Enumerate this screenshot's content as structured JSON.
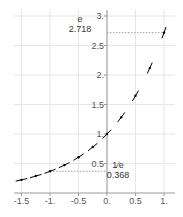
{
  "chart_data": {
    "type": "line",
    "title": "",
    "xlabel": "",
    "ylabel": "",
    "function": "exp(x)",
    "x": [
      -1.5,
      -1.25,
      -1.0,
      -0.75,
      -0.5,
      -0.25,
      0.0,
      0.25,
      0.5,
      0.75,
      1.0
    ],
    "series": [
      {
        "name": "e^x",
        "values": [
          0.223,
          0.287,
          0.368,
          0.472,
          0.607,
          0.779,
          1.0,
          1.284,
          1.649,
          2.117,
          2.718
        ]
      }
    ],
    "xlim": [
      -1.6,
      1.05
    ],
    "ylim": [
      0,
      3.05
    ],
    "x_ticks": [
      "-1.5",
      "-1.",
      "-0.5",
      "0.",
      "0.5",
      "1."
    ],
    "x_tick_values": [
      -1.5,
      -1.0,
      -0.5,
      0.0,
      0.5,
      1.0
    ],
    "y_ticks": [
      "0.5",
      "1.",
      "1.5",
      "2.",
      "2.5",
      "3."
    ],
    "y_tick_values": [
      0.5,
      1.0,
      1.5,
      2.0,
      2.5,
      3.0
    ],
    "grid": true,
    "annotations": [
      {
        "label": "e",
        "value": "2.718",
        "x": 1.0,
        "y": 2.718
      },
      {
        "label": "1/e",
        "value": "0.368",
        "x": -1.0,
        "y": 0.368
      }
    ],
    "colors": {
      "curve": "#000000",
      "grid": "#e6e6e6",
      "axis": "#999999",
      "guide": "#888888"
    }
  }
}
